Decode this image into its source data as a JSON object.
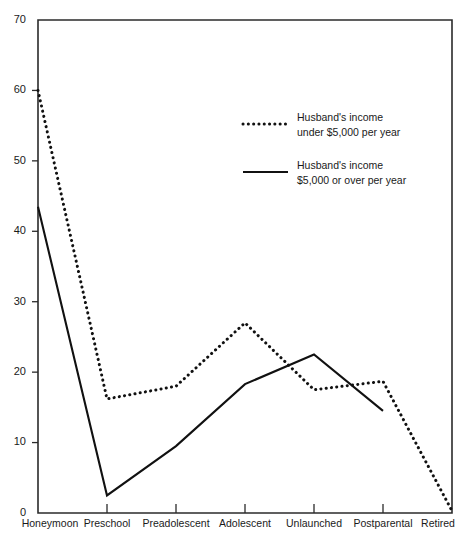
{
  "chart_data": {
    "type": "line",
    "title": "",
    "xlabel": "",
    "ylabel": "",
    "categories": [
      "Honeymoon",
      "Preschool",
      "Preadolescent",
      "Adolescent",
      "Unlaunched",
      "Postparental",
      "Retired"
    ],
    "ylim": [
      0,
      70
    ],
    "yticks": [
      0,
      10,
      20,
      30,
      40,
      50,
      60,
      70
    ],
    "ytick_labels": [
      "0",
      "10",
      "20",
      "30",
      "40",
      "50",
      "60",
      "70"
    ],
    "grid": false,
    "legend_position": "upper-center",
    "series": [
      {
        "name": "Husband's income under $5,000 per year",
        "style": "dotted",
        "color": "#111111",
        "values": [
          60.0,
          16.2,
          18.0,
          27.0,
          17.5,
          18.7,
          0.3
        ]
      },
      {
        "name": "Husband's income $5,000 or over per year",
        "style": "solid",
        "color": "#111111",
        "values": [
          43.5,
          2.5,
          9.5,
          18.3,
          22.5,
          14.5,
          null
        ]
      }
    ]
  },
  "legend": {
    "entries": [
      {
        "swatch": "dotted-line-swatch",
        "line1": "Husband's income",
        "line2": "under $5,000 per year"
      },
      {
        "swatch": "solid-line-swatch",
        "line1": "Husband's income",
        "line2": "$5,000 or over per year"
      }
    ]
  },
  "caption": {
    "text": ""
  }
}
